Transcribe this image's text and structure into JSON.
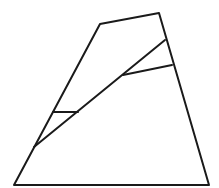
{
  "diagram": {
    "title": "",
    "stroke_color": "#1a1a1a",
    "background": "#ffffff",
    "outline": {
      "points": "14,185 100,24 159,13 209,185"
    },
    "segments": [
      {
        "name": "main-diagonal",
        "x1": 34,
        "y1": 147,
        "x2": 165,
        "y2": 40
      },
      {
        "name": "upper-cross-segment",
        "x1": 123,
        "y1": 75,
        "x2": 172,
        "y2": 65
      },
      {
        "name": "lower-cross-segment",
        "x1": 53,
        "y1": 112,
        "x2": 78,
        "y2": 112
      }
    ]
  }
}
